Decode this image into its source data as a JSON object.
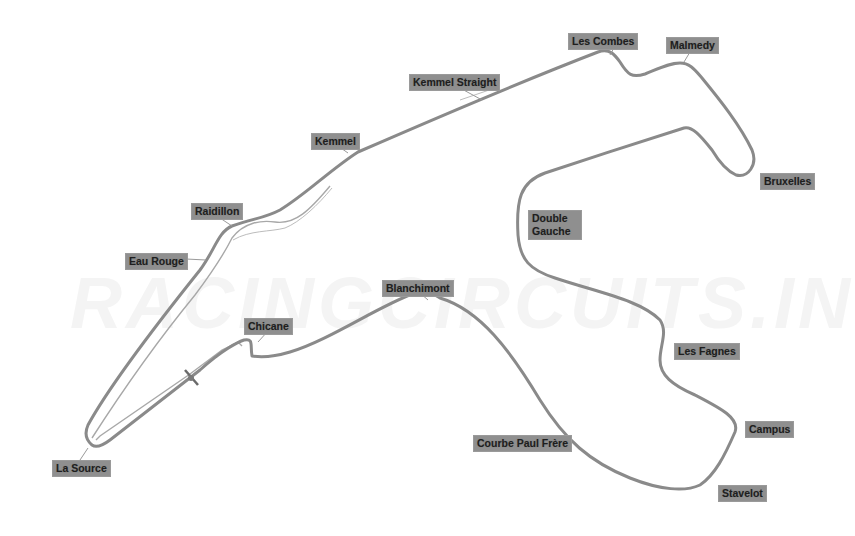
{
  "map": {
    "type": "race-circuit-layout",
    "watermark": "RACINGCIRCUITS.INFO",
    "colors": {
      "track": "#8a8a8a",
      "label_bg": "#8f8f8f",
      "label_text": "#1e1e1e",
      "background": "#ffffff"
    },
    "corners": [
      {
        "id": "la-source",
        "label": "La Source",
        "x": 52,
        "y": 460
      },
      {
        "id": "eau-rouge",
        "label": "Eau Rouge",
        "x": 125,
        "y": 253
      },
      {
        "id": "raidillon",
        "label": "Raidillon",
        "x": 191,
        "y": 203
      },
      {
        "id": "kemmel",
        "label": "Kemmel",
        "x": 311,
        "y": 133
      },
      {
        "id": "kemmel-straight",
        "label": "Kemmel Straight",
        "x": 409,
        "y": 74
      },
      {
        "id": "les-combes",
        "label": "Les Combes",
        "x": 568,
        "y": 33
      },
      {
        "id": "malmedy",
        "label": "Malmedy",
        "x": 666,
        "y": 37
      },
      {
        "id": "bruxelles",
        "label": "Bruxelles",
        "x": 760,
        "y": 173
      },
      {
        "id": "double-gauche",
        "label": "Double Gauche",
        "x": 528,
        "y": 210
      },
      {
        "id": "les-fagnes",
        "label": "Les Fagnes",
        "x": 674,
        "y": 343
      },
      {
        "id": "campus",
        "label": "Campus",
        "x": 745,
        "y": 421
      },
      {
        "id": "stavelot",
        "label": "Stavelot",
        "x": 718,
        "y": 485
      },
      {
        "id": "courbe-paul-frere",
        "label": "Courbe Paul Frère",
        "x": 473,
        "y": 435
      },
      {
        "id": "blanchimont",
        "label": "Blanchimont",
        "x": 382,
        "y": 280
      },
      {
        "id": "chicane",
        "label": "Chicane",
        "x": 244,
        "y": 318
      }
    ]
  }
}
